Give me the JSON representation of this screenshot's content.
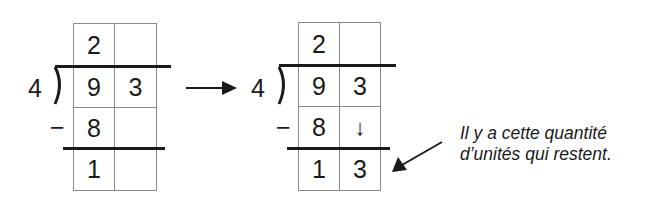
{
  "diagrams": [
    {
      "divisor": "4",
      "quotient": [
        "2",
        ""
      ],
      "dividend": [
        "9",
        "3"
      ],
      "subtract_sign": "−",
      "subtrahend": [
        "8",
        ""
      ],
      "remainder": [
        "1",
        ""
      ]
    },
    {
      "divisor": "4",
      "quotient": [
        "2",
        ""
      ],
      "dividend": [
        "9",
        "3"
      ],
      "subtract_sign": "−",
      "subtrahend": [
        "8",
        "↓"
      ],
      "remainder": [
        "1",
        "3"
      ]
    }
  ],
  "transition_arrow": "right-arrow",
  "annotation": {
    "line1": "Il y a cette quantité",
    "line2": "d’unités qui restent."
  },
  "colors": {
    "ink": "#1a1a1a",
    "grid": "#8a8a8a",
    "background": "#ffffff"
  }
}
